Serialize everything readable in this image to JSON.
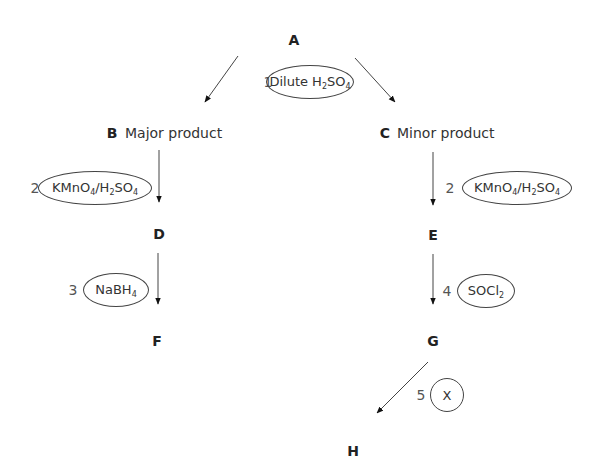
{
  "diagram": {
    "type": "reaction-scheme",
    "nodes": {
      "A": {
        "label": "A"
      },
      "B": {
        "label": "B",
        "description": "Major product"
      },
      "C": {
        "label": "C",
        "description": "Minor product"
      },
      "D": {
        "label": "D"
      },
      "E": {
        "label": "E"
      },
      "F": {
        "label": "F"
      },
      "G": {
        "label": "G"
      },
      "H": {
        "label": "H"
      }
    },
    "steps": [
      {
        "number": "1",
        "reagent_parts": [
          "Dilute H",
          "2",
          "SO",
          "4"
        ],
        "reagent_text": "Dilute H2SO4",
        "from": "A",
        "to": [
          "B",
          "C"
        ]
      },
      {
        "number": "2",
        "reagent_parts": [
          "KMnO",
          "4",
          "/H",
          "2",
          "SO",
          "4"
        ],
        "reagent_text": "KMnO4/H2SO4",
        "from": "B",
        "to": "D"
      },
      {
        "number": "2",
        "reagent_parts": [
          "KMnO",
          "4",
          "/H",
          "2",
          "SO",
          "4"
        ],
        "reagent_text": "KMnO4/H2SO4",
        "from": "C",
        "to": "E"
      },
      {
        "number": "3",
        "reagent_parts": [
          "NaBH",
          "4"
        ],
        "reagent_text": "NaBH4",
        "from": "D",
        "to": "F"
      },
      {
        "number": "4",
        "reagent_parts": [
          "SOCl",
          "2"
        ],
        "reagent_text": "SOCl2",
        "from": "E",
        "to": "G"
      },
      {
        "number": "5",
        "reagent_parts": [
          "X"
        ],
        "reagent_text": "X",
        "from": "G",
        "to": "H"
      }
    ]
  }
}
